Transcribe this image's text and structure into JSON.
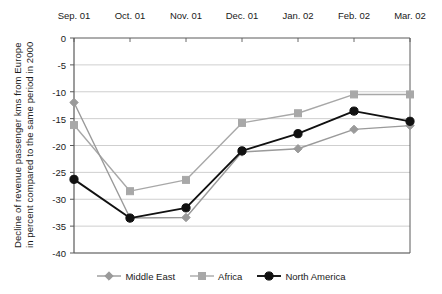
{
  "chart_data": {
    "type": "line",
    "title": "",
    "xlabel": "",
    "ylabel": "Decline of revenue passenger kms from Europe in percent compared to the same period in 2000",
    "ylabel_lines": [
      "Decline of revenue passenger kms from Europe",
      "in percent compared to the same period in 2000"
    ],
    "categories": [
      "Sep. 01",
      "Oct. 01",
      "Nov. 01",
      "Dec. 01",
      "Jan. 02",
      "Feb. 02",
      "Mar. 02"
    ],
    "ylim": [
      -40,
      0
    ],
    "yticks": [
      0,
      -5,
      -10,
      -15,
      -20,
      -25,
      -30,
      -35,
      -40
    ],
    "ytick_labels": [
      "0",
      "-5",
      "-10",
      "-15",
      "-20",
      "-25",
      "-30",
      "-35",
      "-40"
    ],
    "grid": true,
    "x_axis_position": "top",
    "legend_position": "bottom",
    "series": [
      {
        "name": "Middle East",
        "color": "#9a9a9a",
        "marker": "diamond",
        "values": [
          -12.0,
          -33.5,
          -33.4,
          -21.2,
          -20.6,
          -17.0,
          -16.3
        ]
      },
      {
        "name": "Africa",
        "color": "#a8a8a8",
        "marker": "square",
        "values": [
          -16.2,
          -28.5,
          -26.4,
          -15.8,
          -14.0,
          -10.5,
          -10.5
        ]
      },
      {
        "name": "North America",
        "color": "#111111",
        "marker": "circle",
        "values": [
          -26.3,
          -33.5,
          -31.6,
          -21.0,
          -17.8,
          -13.6,
          -15.5
        ]
      }
    ]
  },
  "legend": {
    "items": [
      {
        "label": "Middle East"
      },
      {
        "label": "Africa"
      },
      {
        "label": "North America"
      }
    ]
  },
  "colors": {
    "axis": "#5a5a5a",
    "grid": "#c9c9c9",
    "background": "#ffffff",
    "middle_east": "#9a9a9a",
    "africa": "#a8a8a8",
    "north_america": "#111111"
  }
}
